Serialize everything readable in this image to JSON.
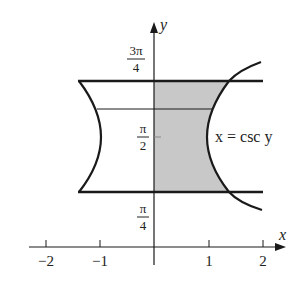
{
  "axes": {
    "x_label": "x",
    "y_label": "y",
    "x_ticks": [
      "−2",
      "−1",
      "1",
      "2"
    ],
    "y_ticks": [
      {
        "num": "3π",
        "den": "4"
      },
      {
        "num": "π",
        "den": "2"
      },
      {
        "num": "π",
        "den": "4"
      }
    ]
  },
  "curve_label": "x = csc y",
  "colors": {
    "shade": "#c8c8c8",
    "stroke": "#1a1a1a"
  }
}
